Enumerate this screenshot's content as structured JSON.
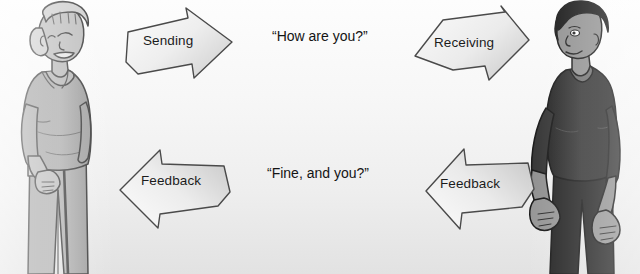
{
  "diagram": {
    "background_color": "#f2f2f2",
    "ink_color": "#1b1b1b"
  },
  "arrows": [
    {
      "id": "sending",
      "label": "Sending",
      "direction": "right",
      "row": "top",
      "fill_color": "#f0f0f0",
      "stroke_color": "#4a4a4a"
    },
    {
      "id": "receiving",
      "label": "Receiving",
      "direction": "right",
      "row": "top",
      "fill_color": "#efefef",
      "stroke_color": "#4a4a4a"
    },
    {
      "id": "feedback-left",
      "label": "Feedback",
      "direction": "left",
      "row": "bottom",
      "fill_color": "#f0f0f0",
      "stroke_color": "#4a4a4a"
    },
    {
      "id": "feedback-right",
      "label": "Feedback",
      "direction": "left",
      "row": "bottom",
      "fill_color": "#efefef",
      "stroke_color": "#4a4a4a"
    }
  ],
  "speech": {
    "top": "“How are you?”",
    "bottom": "“Fine, and you?”"
  },
  "figures": [
    {
      "id": "woman",
      "role": "older-woman-with-cane",
      "side": "left",
      "skin_color": "#b9b9b9",
      "hair_color": "#c8c8c8",
      "clothing_color": "#a8a8a8",
      "outline_color": "#3c3c3c"
    },
    {
      "id": "man",
      "role": "young-man",
      "side": "right",
      "skin_color": "#8f8f8f",
      "hair_color": "#151515",
      "clothing_color": "#2b2b2b",
      "outline_color": "#1a1a1a"
    }
  ]
}
